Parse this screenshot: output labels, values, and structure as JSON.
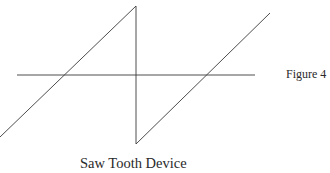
{
  "figure": {
    "label": "Figure 4",
    "caption": "Saw Tooth Device",
    "line_color": "#3a3a3a"
  },
  "diagram": {
    "type": "sawtooth-waveform",
    "axis": {
      "x1": 17,
      "y1": 75,
      "x2": 255,
      "y2": 75
    },
    "waveform_points": [
      [
        0,
        137
      ],
      [
        136,
        6
      ],
      [
        136,
        144
      ],
      [
        270,
        13
      ]
    ]
  }
}
